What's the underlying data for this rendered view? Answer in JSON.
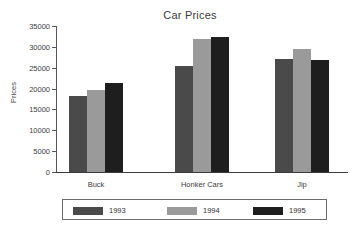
{
  "chart_data": {
    "type": "bar",
    "title": "Car Prices",
    "xlabel": "",
    "ylabel": "Prices",
    "categories": [
      "Buck",
      "Honker Cars",
      "Jip"
    ],
    "series": [
      {
        "name": "1993",
        "color": "#4a4a4a",
        "values": [
          18250,
          25500,
          27150
        ]
      },
      {
        "name": "1994",
        "color": "#9a9a9a",
        "values": [
          19750,
          31800,
          29500
        ]
      },
      {
        "name": "1995",
        "color": "#1e1e1e",
        "values": [
          21350,
          32300,
          26950
        ]
      }
    ],
    "ylim": [
      0,
      35000
    ],
    "yticks": [
      0,
      5000,
      10000,
      15000,
      20000,
      25000,
      30000,
      35000
    ],
    "ytick_labels": [
      "0",
      "5000",
      "10000",
      "15000",
      "20000",
      "25000",
      "30000",
      "35000"
    ],
    "grid": false,
    "legend_position": "bottom"
  },
  "artifact": {
    "text": ""
  }
}
